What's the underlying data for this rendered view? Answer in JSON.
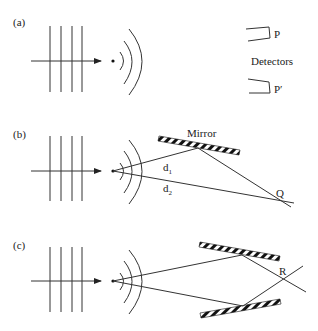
{
  "panels": [
    {
      "label": "(a)"
    },
    {
      "label": "(b)",
      "mirror_label": "Mirror",
      "d1": "d",
      "d1_sub": "1",
      "d2": "d",
      "d2_sub": "2",
      "point": "Q"
    },
    {
      "label": "(c)",
      "point": "R"
    }
  ],
  "detectors": {
    "title": "Detectors",
    "p": "P",
    "p_prime": "P′"
  },
  "colors": {
    "line": "#333333",
    "text": "#222222",
    "background": "#ffffff"
  }
}
